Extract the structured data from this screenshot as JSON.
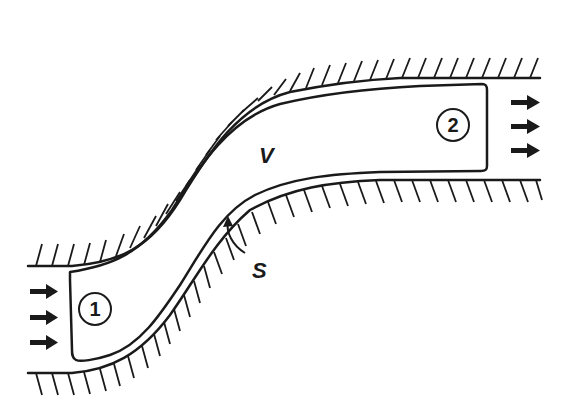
{
  "diagram": {
    "type": "control-volume",
    "labels": {
      "volume": "V",
      "surface": "S",
      "inlet": "1",
      "outlet": "2"
    },
    "colors": {
      "ink": "#1a1a1a",
      "background": "#ffffff"
    },
    "inlet_arrows": 3,
    "outlet_arrows": 3
  }
}
